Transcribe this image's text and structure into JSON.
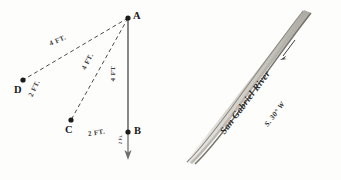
{
  "figure": {
    "background_color": "#fdfdfc",
    "ink_color": "#2a2a2a"
  },
  "triangle_panel": {
    "name": "triangle-diagram",
    "points": [
      {
        "id": "A",
        "label": "A",
        "x": 128,
        "y": 18,
        "label_x": 133,
        "label_y": 12
      },
      {
        "id": "B",
        "label": "B",
        "x": 128,
        "y": 132,
        "label_x": 134,
        "label_y": 127
      },
      {
        "id": "C",
        "label": "C",
        "x": 71,
        "y": 120,
        "label_x": 66,
        "label_y": 126
      },
      {
        "id": "D",
        "label": "D",
        "x": 23,
        "y": 80,
        "label_x": 16,
        "label_y": 86
      }
    ],
    "segments": [
      {
        "id": "AB",
        "from": "A",
        "to": "B",
        "style": "solid",
        "color": "#6b6b6b"
      },
      {
        "id": "AC",
        "from": "A",
        "to": "C",
        "style": "dashed",
        "color": "#4a4a4a"
      },
      {
        "id": "AD",
        "from": "A",
        "to": "D",
        "style": "dashed",
        "color": "#4a4a4a"
      }
    ],
    "arrow": {
      "name": "direction-arrow",
      "from_x": 128,
      "from_y": 132,
      "to_x": 128,
      "to_y": 158,
      "color": "#6b6b6b"
    },
    "dimension_labels": [
      {
        "id": "AD-length",
        "text": "4 FT.",
        "x": 56,
        "y": 45,
        "rotation": -24
      },
      {
        "id": "AC-length",
        "text": "4 FT.",
        "x": 85,
        "y": 70,
        "rotation": -62
      },
      {
        "id": "AB-length",
        "text": "4 FT",
        "x": 113,
        "y": 70,
        "rotation": -90
      },
      {
        "id": "DC-length",
        "text": "2 FT.",
        "x": 34,
        "y": 97,
        "rotation": -64
      },
      {
        "id": "CB-length",
        "text": "2 FT.",
        "x": 90,
        "y": 132,
        "rotation": -8
      }
    ],
    "small_labels": [
      {
        "id": "arrow-note",
        "text": "2 Ft.",
        "x": 122,
        "y": 140,
        "rotation": -88
      }
    ]
  },
  "river_panel": {
    "name": "river-diagram",
    "river_name": "San Gabriel River",
    "bearing": "S. 30° W",
    "band": {
      "fill": "#d9d6d0",
      "edge_color": "#8d8a84",
      "top_x": 128,
      "top_y": 12,
      "bottom_x": 16,
      "bottom_y": 162
    },
    "flow_arrow": {
      "name": "river-flow-arrow",
      "direction": "downstream",
      "x": 118,
      "y": 50,
      "rotation": 215,
      "color": "#3c3c3c"
    },
    "river_name_pos": {
      "x": 52,
      "y": 128,
      "rotation": -53
    },
    "bearing_pos": {
      "x": 96,
      "y": 122,
      "rotation": -53
    }
  }
}
